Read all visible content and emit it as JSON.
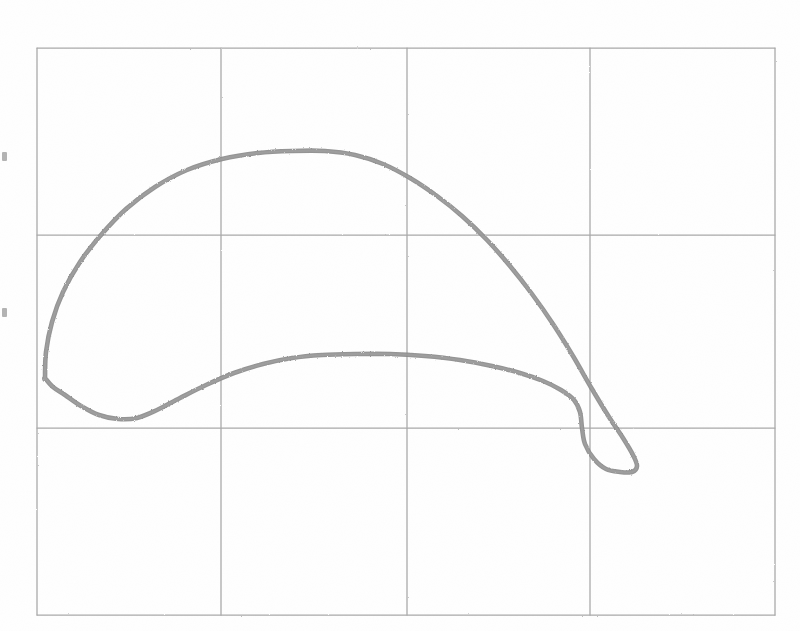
{
  "figure": {
    "title": "",
    "background_color": "#ffffff",
    "width": 800,
    "height": 631,
    "render_style": "photocopied-scan-grainy",
    "grid_color": "#9e9e9e",
    "curve_color": "#8a8a8a"
  },
  "chart_data": {
    "type": "line",
    "title": "",
    "subtitle": "",
    "xlabel": "",
    "ylabel": "",
    "legend": [],
    "legend_position": "none",
    "grid": true,
    "grid_columns": 4,
    "grid_rows": 3,
    "axis_tick_labels_visible": false,
    "xlim": [
      0,
      4
    ],
    "ylim": [
      0,
      3
    ],
    "x_gridlines": [
      0,
      1,
      2,
      3,
      4
    ],
    "y_gridlines": [
      0,
      1,
      2,
      3
    ],
    "annotations": [],
    "series": [
      {
        "name": "closed-loop",
        "closed": true,
        "description": "single closed hysteresis-like loop, crescent shaped, crossing near right side",
        "points_px": [
          [
            45,
            378
          ],
          [
            46,
            352
          ],
          [
            52,
            322
          ],
          [
            63,
            292
          ],
          [
            80,
            262
          ],
          [
            101,
            235
          ],
          [
            126,
            209
          ],
          [
            155,
            187
          ],
          [
            187,
            170
          ],
          [
            222,
            159
          ],
          [
            258,
            153
          ],
          [
            292,
            151
          ],
          [
            325,
            151
          ],
          [
            355,
            155
          ],
          [
            383,
            164
          ],
          [
            410,
            178
          ],
          [
            437,
            196
          ],
          [
            462,
            216
          ],
          [
            487,
            240
          ],
          [
            510,
            266
          ],
          [
            532,
            294
          ],
          [
            553,
            324
          ],
          [
            573,
            356
          ],
          [
            592,
            389
          ],
          [
            609,
            417
          ],
          [
            623,
            438
          ],
          [
            633,
            455
          ],
          [
            637,
            466
          ],
          [
            632,
            472
          ],
          [
            620,
            472
          ],
          [
            606,
            469
          ],
          [
            594,
            459
          ],
          [
            585,
            444
          ],
          [
            582,
            428
          ],
          [
            580,
            412
          ],
          [
            574,
            400
          ],
          [
            561,
            390
          ],
          [
            543,
            381
          ],
          [
            520,
            373
          ],
          [
            492,
            366
          ],
          [
            460,
            360
          ],
          [
            425,
            356
          ],
          [
            390,
            354
          ],
          [
            355,
            354
          ],
          [
            322,
            355
          ],
          [
            292,
            358
          ],
          [
            263,
            364
          ],
          [
            234,
            373
          ],
          [
            206,
            385
          ],
          [
            180,
            398
          ],
          [
            157,
            410
          ],
          [
            137,
            418
          ],
          [
            118,
            419
          ],
          [
            99,
            415
          ],
          [
            81,
            406
          ],
          [
            65,
            395
          ],
          [
            53,
            387
          ],
          [
            45,
            378
          ]
        ],
        "points_data": [
          [
            0.17,
            1.9
          ],
          [
            0.18,
            2.11
          ],
          [
            0.2,
            2.35
          ],
          [
            0.23,
            2.59
          ],
          [
            0.29,
            2.83
          ],
          [
            0.4,
            3.0
          ],
          [
            0.55,
            3.2
          ],
          [
            0.75,
            3.38
          ],
          [
            0.95,
            3.52
          ],
          [
            1.15,
            3.6
          ],
          [
            1.39,
            3.65
          ],
          [
            1.62,
            3.66
          ],
          [
            1.85,
            3.66
          ],
          [
            2.04,
            3.63
          ],
          [
            2.24,
            3.56
          ],
          [
            2.42,
            3.45
          ],
          [
            2.6,
            3.31
          ],
          [
            2.78,
            3.15
          ],
          [
            2.95,
            2.96
          ],
          [
            3.11,
            2.76
          ],
          [
            3.26,
            2.53
          ],
          [
            3.4,
            2.29
          ],
          [
            3.54,
            2.04
          ],
          [
            3.67,
            1.78
          ],
          [
            3.79,
            1.56
          ],
          [
            3.88,
            1.39
          ],
          [
            3.95,
            1.26
          ],
          [
            3.98,
            1.17
          ],
          [
            3.94,
            1.12
          ],
          [
            3.86,
            1.12
          ],
          [
            3.76,
            1.15
          ],
          [
            3.68,
            1.22
          ],
          [
            3.62,
            1.34
          ],
          [
            3.6,
            1.47
          ],
          [
            3.59,
            1.59
          ],
          [
            3.55,
            1.69
          ],
          [
            3.46,
            1.77
          ],
          [
            3.34,
            1.84
          ],
          [
            3.18,
            1.9
          ],
          [
            2.99,
            1.95
          ],
          [
            2.77,
            2.0
          ],
          [
            2.53,
            2.03
          ],
          [
            2.29,
            2.05
          ],
          [
            2.05,
            2.05
          ],
          [
            1.83,
            2.04
          ],
          [
            1.62,
            2.02
          ],
          [
            1.42,
            1.97
          ],
          [
            1.23,
            1.9
          ],
          [
            1.04,
            1.81
          ],
          [
            0.86,
            1.7
          ],
          [
            0.7,
            1.61
          ],
          [
            0.57,
            1.55
          ],
          [
            0.44,
            1.54
          ],
          [
            0.31,
            1.57
          ],
          [
            0.19,
            1.64
          ],
          [
            0.08,
            1.73
          ],
          [
            0.12,
            1.79
          ],
          [
            0.17,
            1.9
          ]
        ]
      }
    ],
    "key_features": {
      "outer_branch_apex_px": [
        325,
        151
      ],
      "inner_branch_apex_px": [
        325,
        354
      ],
      "left_tip_px": [
        45,
        378
      ],
      "left_lobe_bottom_px": [
        120,
        419
      ],
      "right_tip_px": [
        637,
        466
      ],
      "self_intersection_px": [
        590,
        424
      ]
    }
  },
  "edge_marks": [
    {
      "name": "left-edge-mark-upper",
      "x": 2,
      "y": 152
    },
    {
      "name": "left-edge-mark-lower",
      "x": 2,
      "y": 308
    }
  ]
}
